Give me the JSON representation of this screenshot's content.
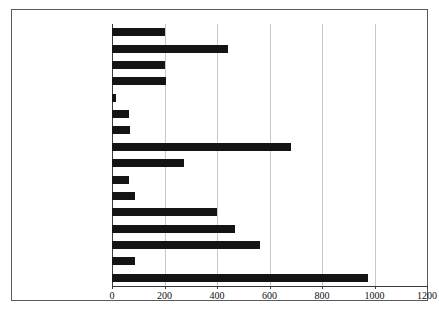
{
  "chart_data": {
    "type": "bar",
    "orientation": "horizontal",
    "title": "",
    "xlabel": "",
    "ylabel": "",
    "xlim": [
      0,
      1200
    ],
    "xticks": [
      0,
      200,
      400,
      600,
      800,
      1000,
      1200
    ],
    "grid": true,
    "legend": null,
    "bar_color": "#141414",
    "gridline_color": "#c9c9c9",
    "categories": [
      "Venezuela",
      "Uruguay",
      "Dominican Republic",
      "Peru",
      "Paraguay",
      "Panama",
      "Nicaragua",
      "Mexico",
      "Honduras",
      "Guatemala",
      "El Salvador",
      "Costa Rica",
      "Chile",
      "Brazil",
      "Bolivia",
      "Argentina"
    ],
    "values": [
      200,
      440,
      200,
      205,
      15,
      65,
      70,
      680,
      273,
      65,
      88,
      400,
      470,
      565,
      88,
      975
    ]
  },
  "caption": {
    "text": "",
    "note": "caption line cropped at bottom edge of image; not legible"
  }
}
